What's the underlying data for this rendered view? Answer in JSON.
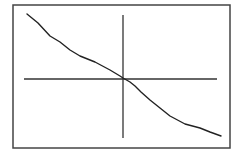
{
  "chart_data": {
    "type": "line",
    "title": "",
    "xlabel": "",
    "ylabel": "",
    "grid": false,
    "legend": null,
    "axes_through_origin": true,
    "series": [
      {
        "name": "curve",
        "description": "monotonically decreasing curve passing through the origin",
        "points_px": [
          [
            27,
            14
          ],
          [
            38,
            23
          ],
          [
            50,
            36
          ],
          [
            60,
            42
          ],
          [
            70,
            50
          ],
          [
            80,
            56
          ],
          [
            95,
            62
          ],
          [
            110,
            70
          ],
          [
            120,
            76
          ],
          [
            123,
            78
          ],
          [
            130,
            82
          ],
          [
            135,
            86
          ],
          [
            138,
            89
          ],
          [
            141,
            92
          ],
          [
            150,
            100
          ],
          [
            160,
            108
          ],
          [
            170,
            116
          ],
          [
            185,
            124
          ],
          [
            200,
            128
          ],
          [
            210,
            132
          ],
          [
            221,
            136
          ]
        ]
      }
    ],
    "frame_px": {
      "x": 13,
      "y": 5,
      "width": 217,
      "height": 143
    },
    "x_axis_px": {
      "y": 79,
      "x1": 24,
      "x2": 217
    },
    "y_axis_px": {
      "x": 123,
      "y1": 15,
      "y2": 138
    }
  },
  "colors": {
    "background": "#ffffff",
    "frame": "#444444",
    "axes": "#333333",
    "curve": "#222222"
  }
}
